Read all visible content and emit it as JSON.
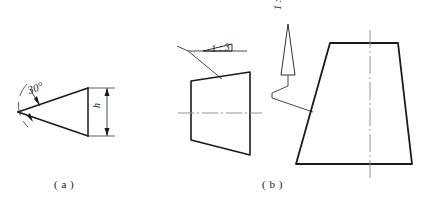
{
  "figure": {
    "background_color": "#ffffff",
    "line_color": "#1a1a1a",
    "centerline_color": "#8a8a8a"
  },
  "captions": {
    "a": "( a )",
    "b": "( b )"
  },
  "part_a": {
    "name": "wedge-taper-angle",
    "angle_label": "30°",
    "height_label": "h",
    "apex_point": [
      18,
      112
    ],
    "upper_edge_end": [
      88,
      88
    ],
    "lower_edge_end": [
      88,
      136
    ],
    "right_edge_top": [
      88,
      88
    ],
    "right_edge_bottom": [
      88,
      136
    ],
    "dimension_line_x": 107,
    "dimension_top_y": 88,
    "dimension_bottom_y": 136,
    "arc_label_angle_deg": 30
  },
  "part_b": {
    "name": "trapezoid-taper-and-slope",
    "taper_label": "1 : 3",
    "slope_label": "1 : 5",
    "small_trapezoid": {
      "top_left": [
        191,
        81
      ],
      "top_right": [
        250,
        72
      ],
      "bottom_right": [
        250,
        155
      ],
      "bottom_left": [
        191,
        140
      ],
      "centerline_y": 113,
      "centerline_x_start": 178,
      "centerline_x_end": 262
    },
    "taper_symbol": {
      "triangle_left": [
        203,
        51
      ],
      "triangle_right": [
        232,
        51
      ],
      "triangle_apex_y": 44,
      "baseline_x_start": 188,
      "baseline_x_end": 247,
      "leader_from": [
        188,
        48
      ],
      "leader_to": [
        222,
        79
      ]
    },
    "large_trapezoid": {
      "top_left": [
        330,
        43
      ],
      "top_right": [
        398,
        43
      ],
      "bottom_right": [
        412,
        164
      ],
      "bottom_left": [
        296,
        164
      ],
      "centerline_x": 370,
      "centerline_y_start": 30,
      "centerline_y_end": 178
    },
    "slope_symbol": {
      "arrow_x": 288,
      "arrow_tip_y": 24,
      "arrow_tail_y": 75,
      "arrow_half_width": 7,
      "leader_jog_x": 272,
      "leader_jog_y": 93,
      "leader_to": [
        313,
        110
      ]
    }
  }
}
